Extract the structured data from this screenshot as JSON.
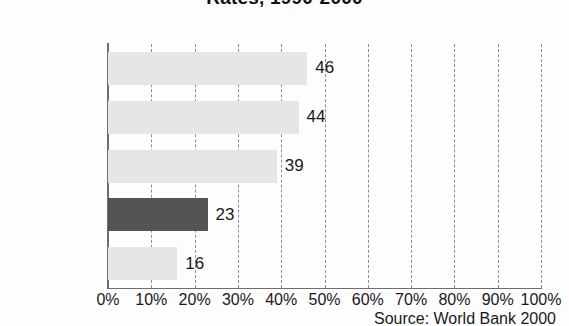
{
  "chart_data": {
    "type": "bar",
    "orientation": "horizontal",
    "title": "Rates, 1990-2000",
    "categories": [
      "Nepal",
      "Sri Lanka",
      "Bangladesh",
      "INDIA",
      "Pakistan"
    ],
    "values": [
      46,
      44,
      39,
      23,
      16
    ],
    "value_labels": [
      "46",
      "44",
      "39",
      "23",
      "16"
    ],
    "highlight_category": "INDIA",
    "xlabel": "",
    "ylabel": "",
    "xlim": [
      0,
      100
    ],
    "xticks": [
      0,
      10,
      20,
      30,
      40,
      50,
      60,
      70,
      80,
      90,
      100
    ],
    "xtick_labels": [
      "0%",
      "10%",
      "20%",
      "30%",
      "40%",
      "50%",
      "60%",
      "70%",
      "80%",
      "90%",
      "100%"
    ],
    "grid": true,
    "grid_style": "dashed-vertical",
    "legend": null,
    "source_note": "Source: World Bank 2000",
    "colors": {
      "bar": "#e6e6e6",
      "bar_highlight": "#545454",
      "axis": "#6e6e6e",
      "grid": "#8d8d8d",
      "text": "#1a1a1a",
      "background": "#fdfdfd"
    }
  }
}
